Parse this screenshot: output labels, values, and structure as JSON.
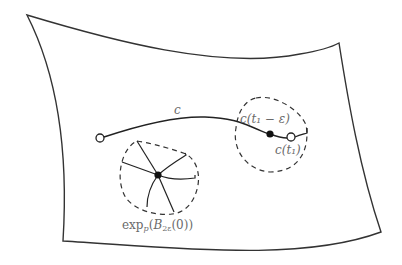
{
  "diagram": {
    "colors": {
      "stroke": "#333333",
      "label": "#6a6a6a",
      "background": "#ffffff"
    },
    "labels": {
      "curve": "c",
      "point_near_end": "c(t₁ − ε)",
      "end_point": "c(t₁)",
      "ball_prefix": "exp",
      "ball_sub": "p",
      "ball_arg_open": "(",
      "ball_B": "B",
      "ball_B_sub": "2ε",
      "ball_arg_close": "(0))"
    },
    "elements": [
      {
        "id": "surface",
        "type": "curved quadrilateral"
      },
      {
        "id": "curve-c",
        "type": "path",
        "start": "open circle",
        "end": "open circle c(t1)"
      },
      {
        "id": "point-c-t1-minus-eps",
        "type": "filled dot"
      },
      {
        "id": "neighborhood-right",
        "type": "dashed closed curve"
      },
      {
        "id": "geodesic-ball",
        "type": "dashed closed curve with 6 radial geodesics"
      },
      {
        "id": "point-p",
        "type": "filled dot"
      }
    ]
  }
}
